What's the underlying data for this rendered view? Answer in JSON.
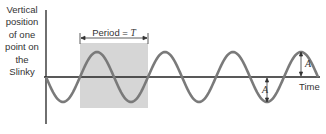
{
  "diagram": {
    "y_axis_label": "Vertical position of one point on the Slinky",
    "y_axis_lines": [
      "Vertical",
      "position",
      "of one",
      "point on",
      "the",
      "Slinky"
    ],
    "x_axis_label": "Time",
    "period_label": "Period = ",
    "period_symbol": "T",
    "amplitude_symbol": "A",
    "colors": {
      "wave": "#7a7a7a",
      "axis": "#222222",
      "shaded_period": "#d6d6d6",
      "text": "#333333"
    },
    "wave": {
      "type": "sine",
      "starts_going": "down",
      "visible_periods": 4,
      "annotations": [
        "Period = T bracket over one full cycle",
        "A amplitude at a trough",
        "A amplitude at a crest"
      ]
    }
  }
}
